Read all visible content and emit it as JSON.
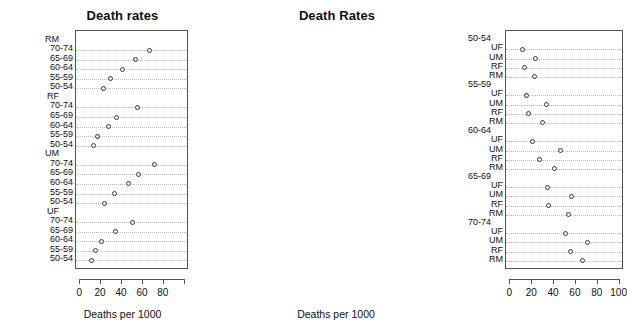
{
  "figure": {
    "width": 431,
    "height": 330,
    "background": "#ffffff",
    "point_color": "#3a3a3a",
    "grid_color": "#b9b9b9",
    "axis_color": "#555555"
  },
  "chart_data": [
    {
      "id": "left",
      "type": "scatter",
      "title": "Death rates",
      "xlabel": "Deaths per 1000",
      "ylabel": "",
      "xlim": [
        -4,
        104
      ],
      "xticks": [
        0,
        20,
        40,
        60,
        80,
        100
      ],
      "xticklabels": [
        "0",
        "20",
        "40",
        "60",
        "80",
        ""
      ],
      "grid": true,
      "legend": "none",
      "group_label_order": [
        "RM",
        "RF",
        "UM",
        "UF"
      ],
      "category_order": [
        "70-74",
        "65-69",
        "60-64",
        "55-59",
        "50-54"
      ],
      "groups": [
        {
          "name": "RM",
          "points": [
            {
              "label": "70-74",
              "value": 66
            },
            {
              "label": "65-69",
              "value": 53
            },
            {
              "label": "60-64",
              "value": 40
            },
            {
              "label": "55-59",
              "value": 29
            },
            {
              "label": "50-54",
              "value": 22
            }
          ]
        },
        {
          "name": "RF",
          "points": [
            {
              "label": "70-74",
              "value": 55
            },
            {
              "label": "65-69",
              "value": 35
            },
            {
              "label": "60-64",
              "value": 27
            },
            {
              "label": "55-59",
              "value": 17
            },
            {
              "label": "50-54",
              "value": 13
            }
          ]
        },
        {
          "name": "UM",
          "points": [
            {
              "label": "70-74",
              "value": 71
            },
            {
              "label": "65-69",
              "value": 56
            },
            {
              "label": "60-64",
              "value": 46
            },
            {
              "label": "55-59",
              "value": 33
            },
            {
              "label": "50-54",
              "value": 23
            }
          ]
        },
        {
          "name": "UF",
          "points": [
            {
              "label": "70-74",
              "value": 50
            },
            {
              "label": "65-69",
              "value": 34
            },
            {
              "label": "60-64",
              "value": 20
            },
            {
              "label": "55-59",
              "value": 15
            },
            {
              "label": "50-54",
              "value": 11
            }
          ]
        }
      ]
    },
    {
      "id": "right",
      "type": "scatter",
      "title": "Death Rates",
      "xlabel": "Deaths per 1000",
      "ylabel": "",
      "xlim": [
        -4,
        104
      ],
      "xticks": [
        0,
        20,
        40,
        60,
        80,
        100
      ],
      "xticklabels": [
        "0",
        "20",
        "40",
        "60",
        "80",
        "100"
      ],
      "grid": true,
      "legend": "none",
      "group_label_order": [
        "50-54",
        "55-59",
        "60-64",
        "65-69",
        "70-74"
      ],
      "category_order": [
        "UF",
        "UM",
        "RF",
        "RM"
      ],
      "groups": [
        {
          "name": "50-54",
          "points": [
            {
              "label": "UF",
              "value": 11
            },
            {
              "label": "UM",
              "value": 23
            },
            {
              "label": "RF",
              "value": 13
            },
            {
              "label": "RM",
              "value": 22
            }
          ]
        },
        {
          "name": "55-59",
          "points": [
            {
              "label": "UF",
              "value": 15
            },
            {
              "label": "UM",
              "value": 33
            },
            {
              "label": "RF",
              "value": 17
            },
            {
              "label": "RM",
              "value": 29
            }
          ]
        },
        {
          "name": "60-64",
          "points": [
            {
              "label": "UF",
              "value": 20
            },
            {
              "label": "UM",
              "value": 46
            },
            {
              "label": "RF",
              "value": 27
            },
            {
              "label": "RM",
              "value": 40
            }
          ]
        },
        {
          "name": "65-69",
          "points": [
            {
              "label": "UF",
              "value": 34
            },
            {
              "label": "UM",
              "value": 56
            },
            {
              "label": "RF",
              "value": 35
            },
            {
              "label": "RM",
              "value": 53
            }
          ]
        },
        {
          "name": "70-74",
          "points": [
            {
              "label": "UF",
              "value": 50
            },
            {
              "label": "UM",
              "value": 71
            },
            {
              "label": "RF",
              "value": 55
            },
            {
              "label": "RM",
              "value": 66
            }
          ]
        }
      ]
    }
  ]
}
